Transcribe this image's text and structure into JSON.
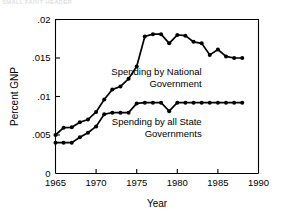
{
  "page": {
    "faint_header_text": "SMALL FAINT HEADER"
  },
  "chart_data": {
    "type": "line",
    "title": "",
    "xlabel": "Year",
    "ylabel": "Percent GNP",
    "xlim": [
      1965,
      1990
    ],
    "ylim": [
      0,
      0.02
    ],
    "xticks": [
      1965,
      1970,
      1975,
      1980,
      1985,
      1990
    ],
    "xtick_labels": [
      "1965",
      "1970",
      "1975",
      "1980",
      "1985",
      "1990"
    ],
    "yticks": [
      0,
      0.005,
      0.01,
      0.015,
      0.02
    ],
    "ytick_labels": [
      "0",
      ".005",
      ".01",
      ".015",
      ".02"
    ],
    "grid": false,
    "legend_position": "inline-annotation",
    "annotations": [
      {
        "name": "national-government-label",
        "line1": "Spending by National",
        "line2": "Government",
        "x": 1983.0,
        "y": 0.0128,
        "align": "right"
      },
      {
        "name": "state-governments-label",
        "line1": "Spending by all State",
        "line2": "Governments",
        "x": 1983.0,
        "y": 0.0063,
        "align": "right"
      }
    ],
    "series": [
      {
        "name": "Spending by National Government",
        "x": [
          1965,
          1966,
          1967,
          1968,
          1969,
          1970,
          1971,
          1972,
          1973,
          1974,
          1975,
          1976,
          1977,
          1978,
          1979,
          1980,
          1981,
          1982,
          1983,
          1984,
          1985,
          1986,
          1987,
          1988
        ],
        "values": [
          0.005,
          0.00595,
          0.006,
          0.00665,
          0.007,
          0.008,
          0.0096,
          0.0109,
          0.0113,
          0.0123,
          0.0139,
          0.0178,
          0.0181,
          0.0181,
          0.0169,
          0.018,
          0.0179,
          0.0171,
          0.0169,
          0.0154,
          0.0161,
          0.0152,
          0.015,
          0.015
        ]
      },
      {
        "name": "Spending by all State Governments",
        "x": [
          1965,
          1966,
          1967,
          1968,
          1969,
          1970,
          1971,
          1972,
          1973,
          1974,
          1975,
          1976,
          1977,
          1978,
          1979,
          1980,
          1981,
          1982,
          1983,
          1984,
          1985,
          1986,
          1987,
          1988
        ],
        "values": [
          0.004,
          0.004,
          0.004,
          0.0047,
          0.0053,
          0.0061,
          0.0077,
          0.0079,
          0.0079,
          0.0079,
          0.0091,
          0.0092,
          0.0092,
          0.0092,
          0.0081,
          0.0092,
          0.0092,
          0.0092,
          0.0092,
          0.0092,
          0.0092,
          0.0092,
          0.0092,
          0.0092
        ]
      }
    ]
  }
}
